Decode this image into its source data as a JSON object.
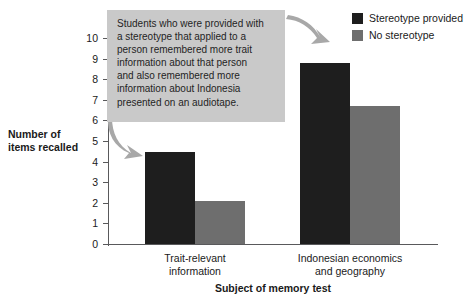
{
  "chart_data": {
    "type": "bar",
    "title": "",
    "categories": [
      "Trait-relevant information",
      "Indonesian economics and geography"
    ],
    "category_lines": [
      [
        "Trait-relevant",
        "information"
      ],
      [
        "Indonesian economics",
        "and geography"
      ]
    ],
    "series": [
      {
        "name": "Stereotype provided",
        "color": "#1e1e1e",
        "values": [
          4.45,
          8.8
        ]
      },
      {
        "name": "No stereotype",
        "color": "#6e6e6e",
        "values": [
          2.1,
          6.7
        ]
      }
    ],
    "xlabel": "Subject of memory test",
    "ylabel": "Number of items recalled",
    "ylabel_lines": [
      "Number of",
      "items recalled"
    ],
    "ylim": [
      0,
      10
    ],
    "ytick_values": [
      0,
      1,
      2,
      3,
      4,
      5,
      6,
      7,
      8,
      9,
      10
    ],
    "ytick_labels": [
      "0",
      "1",
      "2",
      "3",
      "4",
      "5",
      "6",
      "7",
      "8",
      "9",
      "10"
    ],
    "grid": false,
    "legend_position": "top-right"
  },
  "legend": {
    "items": [
      {
        "label": "Stereotype provided",
        "color": "#1e1e1e"
      },
      {
        "label": "No stereotype",
        "color": "#6e6e6e"
      }
    ]
  },
  "annotation": {
    "background": "#c9c9c9",
    "text": "Students who were provided with a stereotype that applied to a person remembered more trait information about that person and also remembered more information about Indonesia presented on an audiotape.",
    "lines": [
      "Students who were provided with",
      "a stereotype that applied to a",
      "person remembered more trait",
      "information about that person",
      "and also remembered more",
      "information about Indonesia",
      "presented on an audiotape."
    ],
    "arrow_color": "#a8a8a8"
  },
  "colors": {
    "axis": "#59595b",
    "background": "#ffffff",
    "text": "#1a1a1a"
  }
}
